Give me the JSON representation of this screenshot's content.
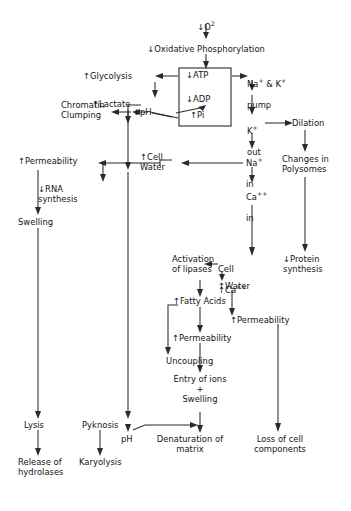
{
  "diagram": {
    "type": "flowchart",
    "background_color": "#ffffff",
    "line_color": "#2b2b2b",
    "text_color": "#141414"
  },
  "nodes": {
    "o2": "↓O",
    "o2_sub": "2",
    "oxidative_phosphorylation": "↓Oxidative  Phosphorylation",
    "glycolysis": "↑Glycolysis",
    "lactate": "↑Lactate",
    "ph_low": "↓pH",
    "chromatin_clumping": "Chromatin\nClumping",
    "atp": "↓ATP",
    "adp": "↓ADP",
    "pi": "↑Pi",
    "na_k_pump": "Na",
    "na_k_pump_sup1": "+",
    "na_k_pump_mid": " & K",
    "na_k_pump_sup2": "+",
    "na_k_pump_line2": "pump",
    "k_out": "K",
    "k_out_sup": "+",
    "k_out_line2": "out",
    "dilation": "Dilation",
    "changes_polysomes": "Changes in\nPolysomes",
    "protein_synthesis": "↓Protein\nsynthesis",
    "permeability_left": "↑Permeability",
    "rna_synthesis": "↓RNA\nsynthesis",
    "swelling_left": "Swelling",
    "cell_water": "↑Cell\nWater",
    "na_in": "Na",
    "na_in_sup": "+",
    "na_in_line2": "in",
    "ca_in": "Ca",
    "ca_in_sup": "++",
    "ca_in_line2": "in",
    "activation_lipases": "Activation\nof lipases",
    "cell_ca": "Cell",
    "cell_ca_line2": "↑Ca",
    "cell_ca_sup": "++",
    "water": "↑Water",
    "fatty_acids": "↑Fatty Acids",
    "permeability_mid": "↑Permeability",
    "permeability_right": "↑Permeability",
    "uncoupling": "Uncoupling",
    "entry_ions_swelling": "Entry of ions\n+\nSwelling",
    "lysis": "Lysis",
    "release_hydrolases": "Release of\nhydrolases",
    "pyknosis": "Pyknosis",
    "karyolysis": "Karyolysis",
    "ph_bottom": "pH",
    "denaturation_matrix": "Denaturation of\nmatrix",
    "loss_cell_components": "Loss of cell\ncomponents"
  }
}
